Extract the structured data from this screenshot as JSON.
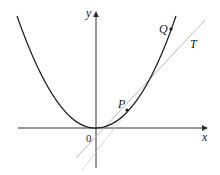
{
  "diagram": {
    "type": "parabola-with-secant-tangent",
    "labels": {
      "x_axis": "x",
      "y_axis": "y",
      "origin": "0",
      "point_p": "P",
      "point_q": "Q",
      "tangent": "T"
    },
    "colors": {
      "curve": "#1a1a1a",
      "axes": "#333333",
      "tangent_line": "#b8b8b8",
      "background": "#ffffff"
    }
  }
}
